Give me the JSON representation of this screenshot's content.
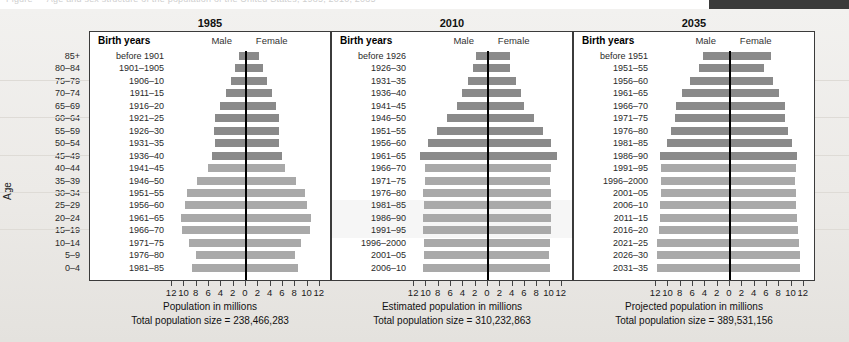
{
  "top_strip": {
    "ghost_text": "Figure — Age and sex structure of the population of the United States, 1985, 2010, 2035"
  },
  "axis": {
    "age_title": "Age",
    "age_labels": [
      "85+",
      "80–84",
      "75–79",
      "70–74",
      "65–69",
      "60–64",
      "55–59",
      "50–54",
      "45–49",
      "40–44",
      "35–39",
      "30–34",
      "25–29",
      "20–24",
      "15–19",
      "10–14",
      "5–9",
      "0–4"
    ],
    "x_ticklabels": [
      "12",
      "10",
      "8",
      "6",
      "4",
      "2",
      "0",
      "2",
      "4",
      "6",
      "8",
      "10",
      "12"
    ],
    "x_tickvalues": [
      -12,
      -10,
      -8,
      -6,
      -4,
      -2,
      0,
      2,
      4,
      6,
      8,
      10,
      12
    ],
    "xmin": -13,
    "xmax": 13
  },
  "legend": {
    "birth_years_label": "Birth years",
    "male_label": "Male",
    "female_label": "Female"
  },
  "colors": {
    "bar_old": "#8a8a8a",
    "bar_young": "#a9a9a9",
    "axis_line": "#000000",
    "panel_bg": "#ffffff",
    "page_bg": "#efeeec"
  },
  "chart_data": {
    "type": "bar",
    "subtype": "population-pyramid",
    "title": "",
    "xlabel": "Population in millions",
    "ylabel": "Age",
    "xlim": [
      -13,
      13
    ],
    "grid": false,
    "legend_position": "top",
    "categories": [
      "85+",
      "80–84",
      "75–79",
      "70–74",
      "65–69",
      "60–64",
      "55–59",
      "50–54",
      "45–49",
      "40–44",
      "35–39",
      "30–34",
      "25–29",
      "20–24",
      "15–19",
      "10–14",
      "5–9",
      "0–4"
    ],
    "panels": [
      {
        "title": "1985",
        "xlabel": "Population in millions",
        "total_label": "Total population size = 238,466,283",
        "total_population": 238466283,
        "birth_years": [
          "before 1901",
          "1901–1905",
          "1906–10",
          "1911–15",
          "1916–20",
          "1921–25",
          "1926–30",
          "1931–35",
          "1936–40",
          "1941–45",
          "1946–50",
          "1951–55",
          "1956–60",
          "1961–65",
          "1966–70",
          "1971–75",
          "1976–80",
          "1981–85"
        ],
        "dark_rows": 9,
        "series": [
          {
            "name": "Male",
            "values": [
              1.2,
              1.8,
              2.4,
              3.3,
              4.2,
              5.0,
              5.2,
              5.1,
              5.6,
              6.2,
              8.0,
              9.6,
              9.9,
              10.5,
              10.4,
              9.2,
              8.1,
              8.7
            ]
          },
          {
            "name": "Female",
            "values": [
              2.1,
              2.7,
              3.4,
              4.3,
              4.8,
              5.3,
              5.4,
              5.3,
              5.8,
              6.4,
              8.2,
              9.6,
              9.9,
              10.5,
              10.4,
              9.0,
              7.9,
              8.4
            ]
          }
        ]
      },
      {
        "title": "2010",
        "xlabel": "Estimated population in millions",
        "total_label": "Total population size = 310,232,863",
        "total_population": 310232863,
        "birth_years": [
          "before 1926",
          "1926–30",
          "1931–35",
          "1936–40",
          "1941–45",
          "1946–50",
          "1951–55",
          "1956–60",
          "1961–65",
          "1966–70",
          "1971–75",
          "1976–80",
          "1981–85",
          "1986–90",
          "1991–95",
          "1996–2000",
          "2001–05",
          "2006–10"
        ],
        "dark_rows": 9,
        "series": [
          {
            "name": "Male",
            "values": [
              1.9,
              2.4,
              3.3,
              4.3,
              5.0,
              6.6,
              8.3,
              9.8,
              11.0,
              10.2,
              10.2,
              10.5,
              10.4,
              10.5,
              10.6,
              10.4,
              10.4,
              10.5
            ]
          },
          {
            "name": "Female",
            "values": [
              3.6,
              3.6,
              4.5,
              5.3,
              5.9,
              7.4,
              8.9,
              10.2,
              11.2,
              10.2,
              10.1,
              10.3,
              10.2,
              10.2,
              10.2,
              10.0,
              9.9,
              10.0
            ]
          }
        ]
      },
      {
        "title": "2035",
        "xlabel": "Projected population in millions",
        "total_label": "Total population size = 389,531,156",
        "total_population": 389531156,
        "birth_years": [
          "before 1951",
          "1951–55",
          "1956–60",
          "1961–65",
          "1966–70",
          "1971–75",
          "1976–80",
          "1981–85",
          "1986–90",
          "1991–95",
          "1996–2000",
          "2001–05",
          "2006–10",
          "2011–15",
          "2016–20",
          "2021–25",
          "2026–30",
          "2031–35"
        ],
        "dark_rows": 9,
        "series": [
          {
            "name": "Male",
            "values": [
              4.4,
              5.1,
              6.5,
              7.8,
              8.8,
              8.9,
              9.6,
              10.3,
              11.3,
              11.2,
              11.2,
              11.2,
              11.3,
              11.4,
              11.6,
              11.8,
              11.9,
              11.9
            ]
          },
          {
            "name": "Female",
            "values": [
              6.7,
              5.6,
              7.0,
              8.0,
              8.9,
              8.9,
              9.4,
              10.0,
              10.9,
              10.7,
              10.6,
              10.7,
              10.8,
              10.9,
              11.0,
              11.2,
              11.3,
              11.4
            ]
          }
        ]
      }
    ]
  }
}
